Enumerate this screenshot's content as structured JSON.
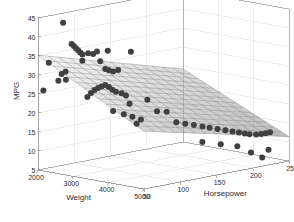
{
  "chart_data": {
    "type": "scatter",
    "title": "",
    "subtitle": "",
    "projection": "3d",
    "xlabel": "Weight",
    "ylabel": "Horsepower",
    "zlabel": "MPG",
    "axis_label_x": "Weight",
    "axis_label_y": "Horsepower",
    "axis_label_z": "MPG",
    "xlim": [
      2000,
      5000
    ],
    "ylim": [
      50,
      250
    ],
    "zlim": [
      5,
      45
    ],
    "xticks": [
      2000,
      3000,
      4000,
      5000
    ],
    "yticks": [
      50,
      100,
      150,
      200,
      250
    ],
    "zticks": [
      5,
      10,
      15,
      20,
      25,
      30,
      35,
      40,
      45
    ],
    "xticklabels": [
      "2000",
      "3000",
      "4000",
      "5000"
    ],
    "yticklabels": [
      "50",
      "100",
      "150",
      "200",
      "250"
    ],
    "zticklabels": [
      "5",
      "10",
      "15",
      "20",
      "25",
      "30",
      "35",
      "40",
      "45"
    ],
    "grid": true,
    "legend": null,
    "legend_position": "none",
    "marker": "filled-circle",
    "marker_color": "#404040",
    "marker_size": 3,
    "surface": {
      "name": "fitted-regression-surface",
      "style": "wireframe-mesh",
      "edge_color": "#7a7a7a",
      "face_color_low": "#ffffff",
      "face_color_high": "#8c8c8c",
      "nx": 14,
      "ny": 14,
      "description": "Gray shaded mesh surface fit of MPG against Weight and Horsepower, descending from about 35 MPG at low weight/low horsepower to about 9 MPG at high weight/high horsepower."
    },
    "points": [
      {
        "x": 2300,
        "y": 70,
        "z": 43.5
      },
      {
        "x": 2100,
        "y": 60,
        "z": 33.0
      },
      {
        "x": 2050,
        "y": 55,
        "z": 25.8
      },
      {
        "x": 2500,
        "y": 72,
        "z": 38.2
      },
      {
        "x": 2520,
        "y": 74,
        "z": 37.6
      },
      {
        "x": 2540,
        "y": 76,
        "z": 37.0
      },
      {
        "x": 2560,
        "y": 78,
        "z": 36.4
      },
      {
        "x": 2580,
        "y": 80,
        "z": 35.8
      },
      {
        "x": 2600,
        "y": 82,
        "z": 35.2
      },
      {
        "x": 2700,
        "y": 85,
        "z": 35.6
      },
      {
        "x": 2780,
        "y": 88,
        "z": 35.4
      },
      {
        "x": 2850,
        "y": 90,
        "z": 36.1
      },
      {
        "x": 3050,
        "y": 95,
        "z": 36.5
      },
      {
        "x": 3500,
        "y": 105,
        "z": 36.6
      },
      {
        "x": 2450,
        "y": 66,
        "z": 31.0
      },
      {
        "x": 2380,
        "y": 64,
        "z": 30.4
      },
      {
        "x": 2330,
        "y": 62,
        "z": 28.6
      },
      {
        "x": 2420,
        "y": 68,
        "z": 28.8
      },
      {
        "x": 2640,
        "y": 80,
        "z": 33.7
      },
      {
        "x": 2900,
        "y": 92,
        "z": 33.6
      },
      {
        "x": 2960,
        "y": 96,
        "z": 31.5
      },
      {
        "x": 3020,
        "y": 98,
        "z": 31.2
      },
      {
        "x": 3100,
        "y": 100,
        "z": 30.9
      },
      {
        "x": 3200,
        "y": 102,
        "z": 31.4
      },
      {
        "x": 2700,
        "y": 84,
        "z": 24.1
      },
      {
        "x": 2760,
        "y": 86,
        "z": 25.2
      },
      {
        "x": 2820,
        "y": 88,
        "z": 26.0
      },
      {
        "x": 2880,
        "y": 90,
        "z": 26.6
      },
      {
        "x": 2940,
        "y": 92,
        "z": 27.0
      },
      {
        "x": 3000,
        "y": 94,
        "z": 27.4
      },
      {
        "x": 3060,
        "y": 96,
        "z": 26.9
      },
      {
        "x": 3120,
        "y": 98,
        "z": 26.2
      },
      {
        "x": 3180,
        "y": 100,
        "z": 25.7
      },
      {
        "x": 3260,
        "y": 104,
        "z": 25.3
      },
      {
        "x": 3340,
        "y": 106,
        "z": 24.8
      },
      {
        "x": 3100,
        "y": 100,
        "z": 20.5
      },
      {
        "x": 3400,
        "y": 108,
        "z": 22.6
      },
      {
        "x": 3520,
        "y": 112,
        "z": 17.4
      },
      {
        "x": 3700,
        "y": 118,
        "z": 23.8
      },
      {
        "x": 3850,
        "y": 124,
        "z": 20.8
      },
      {
        "x": 4000,
        "y": 130,
        "z": 20.7
      },
      {
        "x": 4150,
        "y": 136,
        "z": 18.0
      },
      {
        "x": 4280,
        "y": 142,
        "z": 17.6
      },
      {
        "x": 4400,
        "y": 148,
        "z": 17.2
      },
      {
        "x": 4520,
        "y": 154,
        "z": 16.8
      },
      {
        "x": 4600,
        "y": 160,
        "z": 16.4
      },
      {
        "x": 4700,
        "y": 166,
        "z": 16.0
      },
      {
        "x": 4800,
        "y": 172,
        "z": 15.6
      },
      {
        "x": 4880,
        "y": 178,
        "z": 15.2
      },
      {
        "x": 4940,
        "y": 184,
        "z": 14.8
      },
      {
        "x": 4980,
        "y": 190,
        "z": 14.4
      },
      {
        "x": 4990,
        "y": 196,
        "z": 14.0
      },
      {
        "x": 4995,
        "y": 205,
        "z": 13.6
      },
      {
        "x": 4996,
        "y": 212,
        "z": 13.5
      },
      {
        "x": 4997,
        "y": 218,
        "z": 13.5
      },
      {
        "x": 4998,
        "y": 224,
        "z": 13.5
      },
      {
        "x": 4600,
        "y": 150,
        "z": 13.0
      },
      {
        "x": 4750,
        "y": 168,
        "z": 12.0
      },
      {
        "x": 4850,
        "y": 186,
        "z": 11.0
      },
      {
        "x": 4950,
        "y": 200,
        "z": 9.0
      },
      {
        "x": 4980,
        "y": 214,
        "z": 7.2
      },
      {
        "x": 4995,
        "y": 222,
        "z": 9.0
      },
      {
        "x": 3600,
        "y": 114,
        "z": 18.6
      },
      {
        "x": 3440,
        "y": 110,
        "z": 19.2
      },
      {
        "x": 3300,
        "y": 105,
        "z": 19.8
      }
    ]
  },
  "axes": {
    "x_label": "Weight",
    "y_label": "Horsepower",
    "z_label": "MPG"
  },
  "style": {
    "background": "#ffffff",
    "grid_color": "#e6e6e6",
    "axis_color": "#8f8f8f",
    "text_color": "#2b2b2b",
    "marker_color": "#404040"
  }
}
